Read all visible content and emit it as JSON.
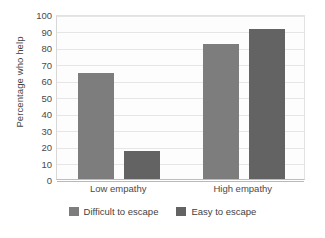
{
  "chart_data": {
    "type": "bar",
    "title": "",
    "subtitle": "",
    "xlabel": "",
    "ylabel": "Percentage who help",
    "categories": [
      "Low empathy",
      "High empathy"
    ],
    "series": [
      {
        "name": "Difficult to escape",
        "color": "#7d7d7d",
        "values": [
          64,
          82
        ]
      },
      {
        "name": "Easy to escape",
        "color": "#636363",
        "values": [
          17,
          91
        ]
      }
    ],
    "ylim": [
      0,
      100
    ],
    "ytick_step": 10,
    "yticks": [
      "100",
      "90",
      "80",
      "70",
      "60",
      "50",
      "40",
      "30",
      "20",
      "10",
      "0"
    ],
    "grid": true,
    "legend_position": "bottom",
    "annotations": []
  },
  "chart": {
    "plot_background": "#fdfdfd",
    "grid_color": "#e6e6e6",
    "axis_color": "#bdbdbd",
    "text_color": "#444444"
  }
}
